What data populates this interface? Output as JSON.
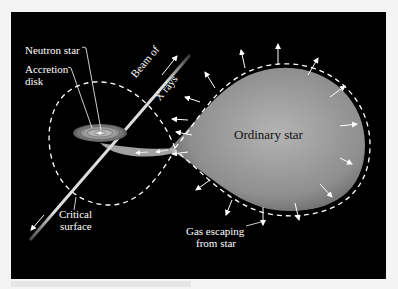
{
  "diagram": {
    "labels": {
      "neutron_star": "Neutron star",
      "accretion_disk_line1": "Accretion",
      "accretion_disk_line2": "disk",
      "beam_line1": "Beam of",
      "beam_line2": "X rays",
      "ordinary_star": "Ordinary star",
      "critical_line1": "Critical",
      "critical_line2": "surface",
      "gas_line1": "Gas escaping",
      "gas_line2": "from star"
    },
    "colors": {
      "background": "#000000",
      "star_fill": "#9a9a9a",
      "lines": "#ffffff",
      "page": "#f4f4f4"
    }
  }
}
